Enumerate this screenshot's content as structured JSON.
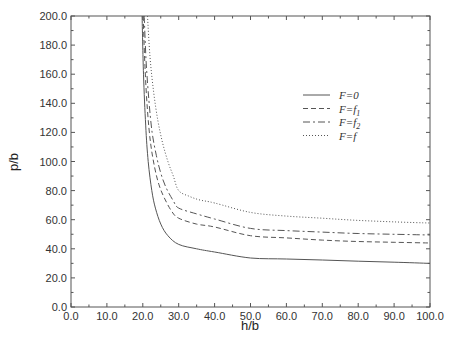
{
  "chart_data": {
    "type": "line",
    "title": "",
    "xlabel": "h/b",
    "ylabel": "p/b",
    "xlim": [
      0,
      100
    ],
    "ylim": [
      0,
      200
    ],
    "grid": false,
    "legend_position": "upper right (inside, mid-right)",
    "x_ticks": [
      "0.0",
      "10.0",
      "20.0",
      "30.0",
      "40.0",
      "50.0",
      "60.0",
      "70.0",
      "80.0",
      "90.0",
      "100.0"
    ],
    "y_ticks": [
      "0.0",
      "20.0",
      "40.0",
      "60.0",
      "80.0",
      "100.0",
      "120.0",
      "140.0",
      "160.0",
      "180.0",
      "200.0"
    ],
    "series": [
      {
        "name": "F=0",
        "style": "solid",
        "x": [
          19.8,
          20.2,
          20.8,
          21.5,
          22.5,
          23.5,
          25,
          27,
          30,
          35,
          40,
          50,
          60,
          70,
          80,
          90,
          100
        ],
        "y": [
          200,
          160,
          125,
          100,
          80,
          68,
          57,
          49,
          43,
          40,
          37.8,
          33.7,
          33,
          32.3,
          31.5,
          30.8,
          30
        ]
      },
      {
        "name": "F=f1",
        "style": "dashed",
        "x": [
          20.1,
          20.6,
          21.3,
          22.2,
          23.3,
          24.5,
          26,
          28,
          30,
          35,
          40,
          50,
          60,
          70,
          80,
          90,
          100
        ],
        "y": [
          200,
          165,
          135,
          112,
          96,
          84,
          75,
          66,
          61,
          57,
          55,
          49,
          47.5,
          46,
          45,
          44.5,
          44
        ]
      },
      {
        "name": "F=f2",
        "style": "dash-dot",
        "x": [
          20.4,
          20.9,
          21.7,
          22.6,
          23.8,
          25,
          26.5,
          28.5,
          30,
          35,
          40,
          50,
          60,
          70,
          80,
          90,
          100
        ],
        "y": [
          200,
          170,
          142,
          120,
          104,
          92,
          82,
          73,
          68,
          64,
          60.5,
          54,
          52.5,
          51.5,
          50.5,
          50,
          49.5
        ]
      },
      {
        "name": "F=f",
        "style": "dotted",
        "x": [
          21.3,
          22,
          23,
          24.2,
          25.5,
          27,
          28.5,
          30,
          33,
          36,
          40,
          50,
          60,
          70,
          80,
          90,
          100
        ],
        "y": [
          200,
          172,
          148,
          128,
          113,
          100,
          90,
          80,
          76,
          73.5,
          71.5,
          65,
          62.5,
          61,
          59.5,
          58.5,
          57.7
        ]
      }
    ]
  },
  "legend": {
    "items": [
      {
        "label": "F=0",
        "style": "solid"
      },
      {
        "label": "F=f1",
        "style": "dashed"
      },
      {
        "label": "F=f2",
        "style": "dash-dot"
      },
      {
        "label": "F=f",
        "style": "dotted"
      }
    ]
  },
  "colors": {
    "line": "#555555",
    "axis": "#555555",
    "text": "#333333",
    "background": "#ffffff"
  }
}
